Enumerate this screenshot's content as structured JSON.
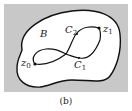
{
  "figure": {
    "caption": "(b)",
    "region_label": "B",
    "curves": [
      {
        "name": "C",
        "sub": "1"
      },
      {
        "name": "C",
        "sub": "2"
      }
    ],
    "points": [
      {
        "name": "z",
        "sub": "0"
      },
      {
        "name": "z",
        "sub": "1"
      }
    ],
    "colors": {
      "background_box": "#c8c8c8",
      "region_fill": "#ffffff",
      "stroke": "#111111"
    }
  }
}
